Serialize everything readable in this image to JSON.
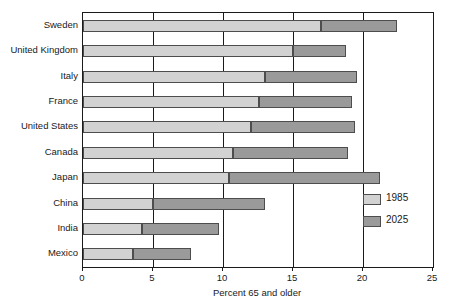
{
  "chart_data": {
    "type": "bar",
    "orientation": "horizontal",
    "stacked": true,
    "title": "",
    "xlabel": "Percent 65 and older",
    "ylabel": "",
    "xlim": [
      0,
      25
    ],
    "xticks": [
      0,
      5,
      10,
      15,
      20,
      25
    ],
    "xtick_labels": [
      "0",
      "5",
      "10",
      "15",
      "20",
      "25"
    ],
    "grid": true,
    "grid_axis": "x",
    "legend_position": "inside-lower-right",
    "categories": [
      "Sweden",
      "United Kingdom",
      "Italy",
      "France",
      "United States",
      "Canada",
      "Japan",
      "China",
      "India",
      "Mexico"
    ],
    "series": [
      {
        "name": "1985",
        "color": "#d2d2d2",
        "values": [
          17.0,
          15.0,
          13.0,
          12.6,
          12.0,
          10.7,
          10.4,
          5.0,
          4.2,
          3.6
        ]
      },
      {
        "name": "2025",
        "color": "#9a9a9a",
        "values": [
          22.4,
          18.8,
          19.6,
          19.2,
          19.4,
          18.9,
          21.2,
          13.0,
          9.7,
          7.7
        ]
      }
    ]
  },
  "legend": {
    "items": [
      {
        "label": "1985",
        "color": "#d2d2d2"
      },
      {
        "label": "2025",
        "color": "#9a9a9a"
      }
    ]
  },
  "axis": {
    "x_label": "Percent 65 and older"
  }
}
